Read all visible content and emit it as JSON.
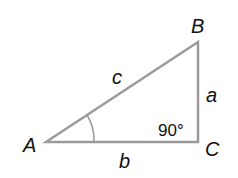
{
  "diagram": {
    "type": "right-triangle",
    "stroke_color": "#9a9a9a",
    "vertices": {
      "A": {
        "label": "A"
      },
      "B": {
        "label": "B"
      },
      "C": {
        "label": "C"
      }
    },
    "sides": {
      "a": {
        "label": "a"
      },
      "b": {
        "label": "b"
      },
      "c": {
        "label": "c"
      }
    },
    "right_angle_label": "90°"
  }
}
